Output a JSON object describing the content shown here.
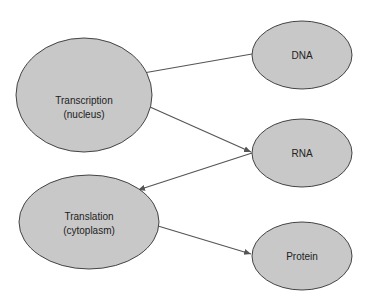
{
  "diagram": {
    "type": "flow",
    "colors": {
      "node_fill": "#c8c8c8",
      "node_stroke": "#444444",
      "edge": "#555555"
    },
    "nodes": [
      {
        "id": "dna",
        "label": [
          "DNA"
        ]
      },
      {
        "id": "transcription",
        "label": [
          "Transcription",
          "(nucleus)"
        ]
      },
      {
        "id": "rna",
        "label": [
          "RNA"
        ]
      },
      {
        "id": "translation",
        "label": [
          "Translation",
          "(cytoplasm)"
        ]
      },
      {
        "id": "protein",
        "label": [
          "Protein"
        ]
      }
    ],
    "edges": [
      {
        "from": "dna",
        "to": "transcription"
      },
      {
        "from": "transcription",
        "to": "rna"
      },
      {
        "from": "rna",
        "to": "translation"
      },
      {
        "from": "translation",
        "to": "protein"
      }
    ]
  }
}
